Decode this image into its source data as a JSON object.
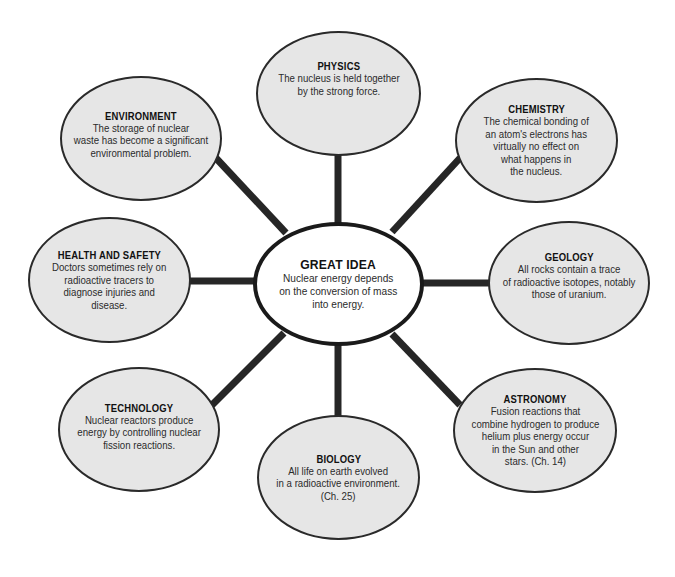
{
  "diagram": {
    "type": "concept-web",
    "colors": {
      "bubble_fill": "#e6e6e6",
      "center_fill": "#ffffff",
      "stroke": "#1a1a1a"
    },
    "center": {
      "title": "GREAT IDEA",
      "body": "Nuclear energy depends\non the conversion of mass\ninto energy."
    },
    "nodes": [
      {
        "id": "physics",
        "title": "PHYSICS",
        "body": "The nucleus is held together\nby the strong force."
      },
      {
        "id": "chemistry",
        "title": "CHEMISTRY",
        "body": "The chemical bonding of\nan atom's electrons has\nvirtually no effect on\nwhat happens in\nthe nucleus."
      },
      {
        "id": "geology",
        "title": "GEOLOGY",
        "body": "All rocks contain a trace\nof radioactive isotopes, notably\nthose of uranium."
      },
      {
        "id": "astronomy",
        "title": "ASTRONOMY",
        "body": "Fusion reactions that\ncombine hydrogen to produce\nhelium plus energy occur\nin the Sun and other\nstars. (Ch. 14)"
      },
      {
        "id": "biology",
        "title": "BIOLOGY",
        "body": "All life on earth evolved\nin a radioactive environment.\n(Ch. 25)"
      },
      {
        "id": "technology",
        "title": "TECHNOLOGY",
        "body": "Nuclear reactors produce\nenergy by controlling nuclear\nfission reactions."
      },
      {
        "id": "health",
        "title": "HEALTH AND SAFETY",
        "body": "Doctors sometimes rely on\nradioactive tracers to\ndiagnose injuries and\ndisease."
      },
      {
        "id": "environment",
        "title": "ENVIRONMENT",
        "body": "The storage of nuclear\nwaste has become a significant\nenvironmental problem."
      }
    ]
  }
}
